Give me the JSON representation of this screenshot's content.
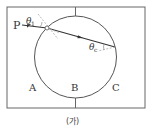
{
  "diagram": {
    "caption": "(가)",
    "labels": {
      "point_p": "P",
      "theta1": "θ",
      "theta1_sub": "1",
      "thetac": "θ",
      "thetac_sub": "c",
      "region_a": "A",
      "region_b": "B",
      "region_c": "C"
    },
    "colors": {
      "line": "#555555",
      "dashed": "#999999",
      "background": "#ffffff"
    }
  }
}
